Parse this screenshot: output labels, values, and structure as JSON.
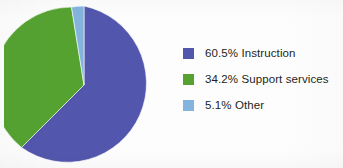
{
  "chart_data": {
    "type": "pie",
    "title": "",
    "subtitle": "",
    "xlabel": "",
    "ylabel": "",
    "grid": false,
    "legend_position": "right",
    "start_angle_deg": 0,
    "direction": "clockwise",
    "total_percent": "99.8",
    "categories": [
      "Instruction",
      "Support services",
      "Other"
    ],
    "values": [
      60.5,
      34.2,
      5.1
    ],
    "value_suffix": "%",
    "colors": [
      "#5257ad",
      "#55a231",
      "#84b4dd"
    ],
    "slices": [
      {
        "label": "Instruction",
        "value": 60.5,
        "value_text": "60.5%",
        "color": "#5257ad",
        "sweep_deg": 217.8,
        "start_deg": 0,
        "path": "M 80 80 L 80 1 A 79 79 0 1 1 17.5 142.5 Z"
      },
      {
        "label": "Support services",
        "value": 34.2,
        "value_text": "34.2%",
        "color": "#55a231",
        "sweep_deg": 123.1,
        "start_deg": 217.8,
        "path": "M 80 80 L 17.5 142.5 A 79 79 0 0 1 67.5 2.1 Z"
      },
      {
        "label": "Other",
        "value": 5.1,
        "value_text": "5.1%",
        "color": "#84b4dd",
        "sweep_deg": 18.4,
        "start_deg": 340.9,
        "path": "M 80 80 L 67.5 2.1 A 79 79 0 0 1 80 1 Z"
      }
    ]
  },
  "legend": {
    "items": [
      {
        "swatch_name": "instruction",
        "label": "60.5% Instruction",
        "color": "#5257ad"
      },
      {
        "swatch_name": "support-services",
        "label": "34.2% Support services",
        "color": "#55a231"
      },
      {
        "swatch_name": "other",
        "label": "5.1% Other",
        "color": "#84b4dd"
      }
    ]
  },
  "palette": {
    "background": "#fdfdfd",
    "text": "#231f20",
    "blue": "#5257ad",
    "green": "#55a231",
    "light_blue": "#84b4dd"
  }
}
